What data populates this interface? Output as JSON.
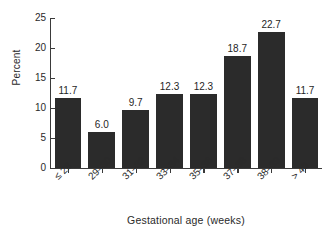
{
  "chart_data": {
    "type": "bar",
    "title": "",
    "subtitle": "",
    "xlabel": "Gestational age (weeks)",
    "ylabel": "Percent",
    "categories": [
      "≤ 28",
      "29–30",
      "31–32",
      "33–34",
      "35–36",
      "37–38",
      "38–39",
      "> 40"
    ],
    "values": [
      11.7,
      6.0,
      9.7,
      12.3,
      12.3,
      18.7,
      22.7,
      11.7
    ],
    "value_labels": [
      "11.7",
      "6.0",
      "9.7",
      "12.3",
      "12.3",
      "18.7",
      "22.7",
      "11.7"
    ],
    "ylim": [
      0,
      25
    ],
    "yticks": [
      0,
      5,
      10,
      15,
      20,
      25
    ],
    "ytick_labels": [
      "0",
      "5",
      "10",
      "15",
      "20",
      "25"
    ],
    "grid": false,
    "legend": false,
    "legend_position": "none",
    "bar_color": "#2b2b2b",
    "axis_color": "#3a3a3a",
    "background_color": "#ffffff",
    "xtick_label_rotation": -45
  }
}
